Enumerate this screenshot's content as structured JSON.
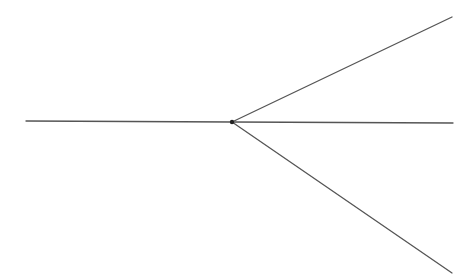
{
  "diagram": {
    "stroke_color": "#555555",
    "vertex": {
      "x": 232,
      "y": 122
    },
    "segments": [
      {
        "name": "left-ray",
        "x1": 26,
        "y1": 121,
        "x2": 232,
        "y2": 122
      },
      {
        "name": "upper-ray",
        "x1": 232,
        "y1": 122,
        "x2": 452,
        "y2": 17
      },
      {
        "name": "middle-ray",
        "x1": 232,
        "y1": 122,
        "x2": 453,
        "y2": 123
      },
      {
        "name": "lower-ray",
        "x1": 232,
        "y1": 122,
        "x2": 452,
        "y2": 273
      }
    ]
  }
}
